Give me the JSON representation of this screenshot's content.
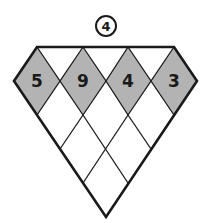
{
  "puzzle": {
    "label": "4",
    "top_row": [
      {
        "value": "5",
        "cx": 37,
        "cy": 81
      },
      {
        "value": "9",
        "cx": 83,
        "cy": 81
      },
      {
        "value": "4",
        "cx": 128,
        "cy": 81
      },
      {
        "value": "3",
        "cx": 174,
        "cy": 81
      }
    ],
    "empty_rows": [
      [
        {
          "cx": 60,
          "cy": 115
        },
        {
          "cx": 106,
          "cy": 115
        },
        {
          "cx": 151,
          "cy": 115
        }
      ],
      [
        {
          "cx": 83,
          "cy": 149
        },
        {
          "cx": 128,
          "cy": 149
        }
      ],
      [
        {
          "cx": 106,
          "cy": 183
        }
      ]
    ],
    "colors": {
      "shaded": "#b3b3b3",
      "line": "#1a1a1a",
      "background": "#ffffff"
    }
  }
}
